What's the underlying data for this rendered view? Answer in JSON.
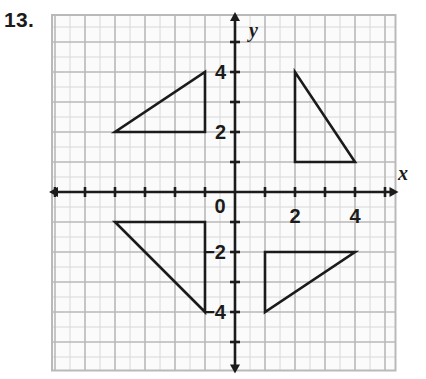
{
  "exercise": {
    "number_label": "13."
  },
  "chart_data": {
    "type": "scatter",
    "title": "",
    "xlabel": "x",
    "ylabel": "y",
    "xlim": [
      -6,
      5.3
    ],
    "ylim": [
      -5.9,
      5.9
    ],
    "grid": true,
    "minor_grid": true,
    "unit_px": 30,
    "origin_px": [
      235,
      192
    ],
    "origin_label": "0",
    "legend": "none",
    "x_ticks": [
      2,
      4
    ],
    "x_tick_labels": [
      "2",
      "4"
    ],
    "y_ticks": [
      4,
      2,
      -2,
      -4
    ],
    "y_tick_labels": [
      "4",
      "2",
      "−2",
      "−4"
    ],
    "shapes": [
      {
        "name": "triangle-quadrant-ii",
        "kind": "triangle",
        "vertices": [
          [
            -4,
            2
          ],
          [
            -1,
            2
          ],
          [
            -1,
            4
          ]
        ]
      },
      {
        "name": "triangle-quadrant-i",
        "kind": "triangle",
        "vertices": [
          [
            2,
            4
          ],
          [
            2,
            1
          ],
          [
            4,
            1
          ]
        ]
      },
      {
        "name": "triangle-quadrant-iii",
        "kind": "triangle",
        "vertices": [
          [
            -4,
            -1
          ],
          [
            -1,
            -1
          ],
          [
            -1,
            -4
          ]
        ]
      },
      {
        "name": "triangle-quadrant-iv",
        "kind": "triangle",
        "vertices": [
          [
            1,
            -2
          ],
          [
            4,
            -2
          ],
          [
            1,
            -4
          ]
        ]
      }
    ],
    "colors": {
      "shape_stroke": "#1b1b1b",
      "axis": "#1b1b1b",
      "major_grid": "#b9b9b9",
      "minor_grid": "#d8d8d8",
      "background": "#fbfbfb"
    }
  }
}
